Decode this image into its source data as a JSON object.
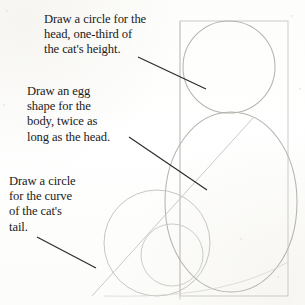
{
  "page": {
    "background_color": "#fdfdfc",
    "ink_color": "#1b1b1b",
    "pencil_color": "#b9b9b4"
  },
  "captions": [
    {
      "id": "head",
      "text": "Draw a circle for the\nhead, one-third of\nthe cat's height.",
      "target": "head-circle"
    },
    {
      "id": "body",
      "text": "Draw an egg\nshape for the\nbody, twice as\nlong as the head.",
      "target": "body-egg"
    },
    {
      "id": "tail",
      "text": "Draw a circle\nfor the curve\nof the cat's\ntail.",
      "target": "tail-circle"
    }
  ],
  "leaders": [
    {
      "id": "leader-head",
      "x1": 138,
      "y1": 57,
      "x2": 206,
      "y2": 89
    },
    {
      "id": "leader-body",
      "x1": 129,
      "y1": 137,
      "x2": 207,
      "y2": 190
    },
    {
      "id": "leader-tail",
      "x1": 37,
      "y1": 237,
      "x2": 96,
      "y2": 268
    }
  ],
  "shapes": {
    "frame_rect": {
      "x": 180,
      "y": 21,
      "width": 108,
      "height": 275
    },
    "head_circle": {
      "cx": 229,
      "cy": 67,
      "r": 46
    },
    "body_egg": {
      "cx": 231,
      "cy": 202,
      "rx": 66,
      "ry": 90
    },
    "tail_circle": {
      "cx": 157,
      "cy": 243,
      "r": 53
    },
    "inner_small_circle": {
      "cx": 172,
      "cy": 255,
      "r": 31
    },
    "diagonal_line": {
      "x1": 253,
      "y1": 118,
      "x2": 92,
      "y2": 296
    },
    "vertical_axis": {
      "x": 180,
      "y1": 21,
      "y2": 300
    }
  }
}
